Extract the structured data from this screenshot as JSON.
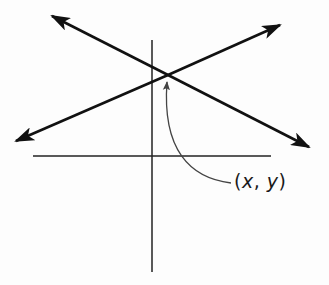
{
  "diagram": {
    "type": "two intersecting lines on coordinate axes",
    "colors": {
      "line": "#111111",
      "axis": "#222222",
      "pointer": "#444444",
      "background": "#fdfdfd"
    },
    "axes": {
      "horizontal": {
        "x1": 33,
        "y1": 156,
        "x2": 271,
        "y2": 156
      },
      "vertical": {
        "x1": 152,
        "y1": 40,
        "x2": 152,
        "y2": 272
      }
    },
    "lines": [
      {
        "name": "decreasing-line",
        "from": [
          52,
          16
        ],
        "to": [
          309,
          147
        ]
      },
      {
        "name": "increasing-line",
        "from": [
          16,
          141
        ],
        "to": [
          280,
          25
        ]
      }
    ],
    "intersection": [
      168,
      75
    ],
    "label": {
      "open": "(",
      "x": "x",
      "sep": ", ",
      "y": "y",
      "close": ")"
    }
  }
}
